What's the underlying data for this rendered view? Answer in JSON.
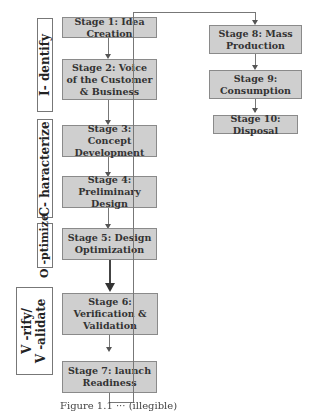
{
  "phases": [
    {
      "label": "I- dentify"
    },
    {
      "label": "C- haracterize"
    },
    {
      "label": "O -ptimize"
    },
    {
      "label": "V -rify/\nV -alidate",
      "line1": "V -rify/",
      "line2": "V -alidate"
    }
  ],
  "stages": [
    {
      "label": "Stage 1: Idea Creation"
    },
    {
      "label": "Stage 2: Voice of the Customer & Business"
    },
    {
      "label": "Stage 3: Concept Development"
    },
    {
      "label": "Stage 4: Preliminary Design"
    },
    {
      "label": "Stage 5: Design Optimization"
    },
    {
      "label": "Stage 6: Verification & Validation"
    },
    {
      "label": "Stage 7: launch Readiness"
    },
    {
      "label": "Stage 8: Mass Production"
    },
    {
      "label": "Stage 9: Consumption"
    },
    {
      "label": "Stage 10: Disposal"
    }
  ],
  "caption": "Figure 1.1 ··· (illegible)",
  "colors": {
    "box_fill": "#cfcfcf",
    "box_border": "#8a8a8a",
    "line": "#777777"
  }
}
